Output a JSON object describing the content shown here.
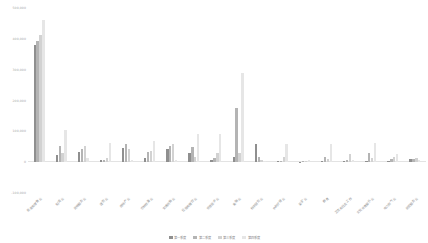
{
  "chart_data": {
    "type": "bar",
    "title": "",
    "xlabel": "",
    "ylabel": "",
    "ylim": [
      -100000,
      500000
    ],
    "grid": false,
    "legend_position": "bottom",
    "ytick_labels": [
      "500,000",
      "400,000",
      "300,000",
      "200,000",
      "100,000",
      "0",
      "-100,000"
    ],
    "ytick_values": [
      500000,
      400000,
      300000,
      200000,
      100000,
      0,
      -100000
    ],
    "categories": [
      "批发和零售业",
      "制造业",
      "其他服务业",
      "建筑业",
      "房地产业",
      "农林牧渔业",
      "交通运输业",
      "住宿和餐饮业",
      "信息技术业",
      "金融业",
      "科学研究业",
      "水利环境业",
      "采矿业",
      "教育",
      "卫生和社会工作",
      "文化体育娱乐业",
      "电力燃气业",
      "居民服务业"
    ],
    "series": [
      {
        "name": "第一季度",
        "color": "#8f8f8f",
        "values": [
          380000,
          22000,
          34000,
          6000,
          46000,
          12000,
          42000,
          30000,
          8000,
          17000,
          60000,
          4000,
          2000,
          3000,
          4000,
          2500,
          3000,
          9000
        ]
      },
      {
        "name": "第二季度",
        "color": "#b4b4b4",
        "values": [
          392000,
          52000,
          44000,
          8000,
          60000,
          33000,
          52000,
          50000,
          15000,
          175000,
          18000,
          5000,
          2500,
          18000,
          8000,
          31000,
          10000,
          11000
        ]
      },
      {
        "name": "第三季度",
        "color": "#d2d2d2",
        "values": [
          412000,
          30000,
          52000,
          12000,
          42000,
          36000,
          60000,
          18000,
          30000,
          30000,
          7000,
          16000,
          4000,
          10000,
          26000,
          13000,
          17000,
          13000
        ]
      },
      {
        "name": "第四季度",
        "color": "#e6e6e6",
        "values": [
          462000,
          104000,
          12000,
          62000,
          7000,
          70000,
          6000,
          90000,
          92000,
          290000,
          5000,
          58000,
          6000,
          60000,
          6000,
          62000,
          26000,
          6000
        ]
      }
    ]
  }
}
